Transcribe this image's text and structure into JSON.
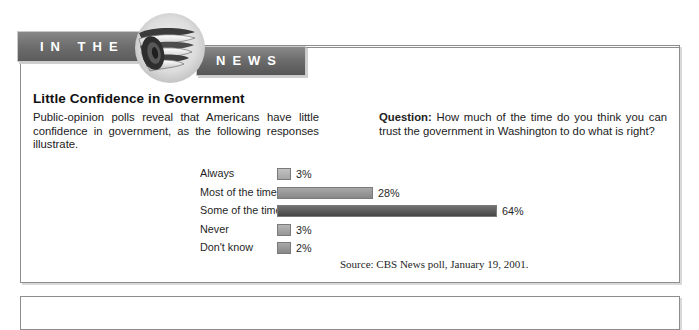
{
  "banner": {
    "left_text": "IN THE",
    "right_text": "NEWS",
    "emblem_icon": "rolled-newspaper-icon"
  },
  "article": {
    "headline": "Little Confidence in Government",
    "lede": "Public-opinion polls reveal that Americans have little confidence in government, as the following responses illustrate.",
    "question_label": "Question:",
    "question_text": "How much of the time do you think you can trust the government in Washington to do what is right?",
    "source": "Source: CBS News poll, January 19, 2001."
  },
  "colors": {
    "bar_light": "#b0b0b0",
    "bar_medium": "#909090",
    "bar_dark": "#4a4a4a",
    "banner_gray": "#6f6f6f",
    "frame_gray": "#8d8d8d"
  },
  "chart_data": {
    "type": "bar",
    "orientation": "horizontal",
    "title": "Little Confidence in Government",
    "xlabel": "",
    "ylabel": "",
    "xlim": [
      0,
      70
    ],
    "grid": false,
    "legend": null,
    "unit": "%",
    "categories": [
      "Always",
      "Most of the time",
      "Some of the time",
      "Never",
      "Don't know"
    ],
    "values": [
      3,
      28,
      64,
      3,
      2
    ],
    "value_labels": [
      "3%",
      "28%",
      "64%",
      "3%",
      "2%"
    ],
    "bar_colors": [
      "#b0b0b0",
      "#909090",
      "#4a4a4a",
      "#a0a0a0",
      "#909090"
    ],
    "source": "Source: CBS News poll, January 19, 2001."
  }
}
